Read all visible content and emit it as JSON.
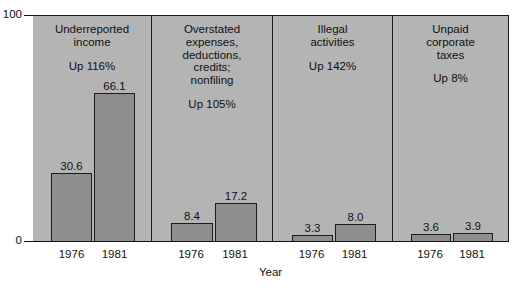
{
  "chart_data": {
    "type": "bar",
    "title": "",
    "xlabel": "Year",
    "ylabel": "",
    "ylim": [
      0,
      100
    ],
    "ytick_labels": [
      "0",
      "100"
    ],
    "grid": false,
    "legend": "none",
    "categories": [
      "1976",
      "1981"
    ],
    "panels": [
      {
        "title": "Underreported\nincome",
        "subtitle": "Up 116%",
        "values": [
          30.6,
          66.1
        ],
        "value_labels": [
          "30.6",
          "66.1"
        ],
        "tick_labels": [
          "1976",
          "1981"
        ]
      },
      {
        "title": "Overstated\nexpenses,\ndeductions,\ncredits;\nnonfiling",
        "subtitle": "Up 105%",
        "values": [
          8.4,
          17.2
        ],
        "value_labels": [
          "8.4",
          "17.2"
        ],
        "tick_labels": [
          "1976",
          "1981"
        ]
      },
      {
        "title": "Illegal\nactivities",
        "subtitle": "Up 142%",
        "values": [
          3.3,
          8.0
        ],
        "value_labels": [
          "3.3",
          "8.0"
        ],
        "tick_labels": [
          "1976",
          "1981"
        ]
      },
      {
        "title": "Unpaid\ncorporate\ntaxes",
        "subtitle": "Up 8%",
        "values": [
          3.6,
          3.9
        ],
        "value_labels": [
          "3.6",
          "3.9"
        ],
        "tick_labels": [
          "1976",
          "1981"
        ]
      }
    ],
    "colors": {
      "bar_fill": "#8e8e8e",
      "bar_edge": "#1c1c1c",
      "panel_background": "#b4b4b4",
      "axis": "#111111",
      "page_background": "#ffffff"
    }
  },
  "axis": {
    "y_top_label": "100",
    "y_bottom_label": "0",
    "x_title": "Year"
  }
}
